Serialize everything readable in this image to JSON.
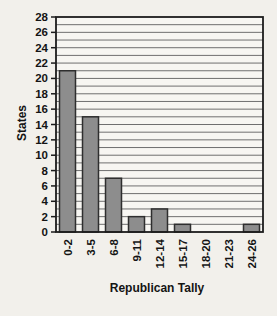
{
  "chart_data": {
    "type": "bar",
    "title": "",
    "xlabel": "Republican Tally",
    "ylabel": "States",
    "categories": [
      "0-2",
      "3-5",
      "6-8",
      "9-11",
      "12-14",
      "15-17",
      "18-20",
      "21-23",
      "24-26"
    ],
    "values": [
      21,
      15,
      7,
      2,
      3,
      1,
      0,
      0,
      1
    ],
    "ylim": [
      0,
      28
    ],
    "ytick_step": 2,
    "ytick_labels": [
      "0",
      "2",
      "4",
      "6",
      "8",
      "10",
      "12",
      "14",
      "16",
      "18",
      "20",
      "22",
      "24",
      "26",
      "28"
    ],
    "grid": "horizontal gridlines every 1 unit",
    "legend": "none",
    "colors": {
      "page_bg": "#f2f0eb",
      "plot_bg": "#f7f6f2",
      "bar_fill": "#8d8d8d",
      "bar_stroke": "#2e2e2e",
      "grid_line": "#6f6f6f",
      "axis_line": "#1c1c1c",
      "text": "#141414"
    }
  }
}
